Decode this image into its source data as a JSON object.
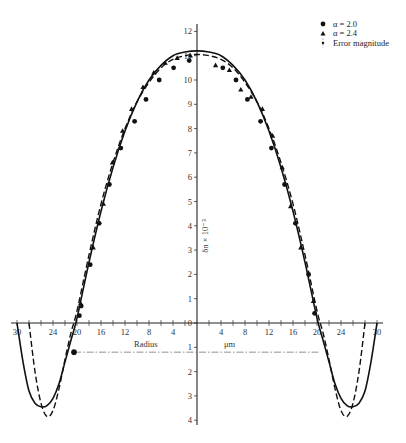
{
  "chart_data": {
    "type": "line",
    "title": "",
    "xlabel": "Radius",
    "xunit": "μm",
    "ylabel": "δn × 10⁻³",
    "xlim": [
      -31,
      31
    ],
    "ylim": [
      -4.2,
      12.3
    ],
    "x_ticks_labeled": [
      -30,
      -24,
      -20,
      -16,
      -12,
      -8,
      -4,
      4,
      8,
      12,
      16,
      20,
      24,
      30
    ],
    "x_tick_labels": [
      "30",
      "24",
      "20",
      "16",
      "12",
      "8",
      "4",
      "4",
      "8",
      "12",
      "16",
      "20",
      "24",
      "30"
    ],
    "y_ticks": [
      -4,
      -3,
      -2,
      -1,
      0,
      1,
      2,
      3,
      4,
      5,
      6,
      7,
      8,
      9,
      10,
      11,
      12
    ],
    "grid": false,
    "legend_position": "top-right",
    "legend": [
      {
        "marker": "circle",
        "label": "α = 2.0"
      },
      {
        "marker": "triangle",
        "label": "α = 2.4"
      },
      {
        "marker": "errorbar",
        "label": "Error magnitude"
      }
    ],
    "series": [
      {
        "name": "α = 2.0 (fit)",
        "style": "solid",
        "x": [
          -30,
          -29,
          -28,
          -27,
          -26,
          -25,
          -24,
          -23,
          -22,
          -21,
          -20,
          -18,
          -16,
          -14,
          -12,
          -10,
          -8,
          -6,
          -4,
          -2,
          0,
          2,
          4,
          6,
          8,
          10,
          12,
          14,
          16,
          18,
          20,
          21,
          22,
          23,
          24,
          25,
          26,
          27,
          28,
          29,
          30
        ],
        "y": [
          0.0,
          -1.6,
          -2.8,
          -3.3,
          -3.45,
          -3.4,
          -3.1,
          -2.5,
          -1.6,
          -0.7,
          0.2,
          2.5,
          4.6,
          6.4,
          7.9,
          9.1,
          10.0,
          10.6,
          11.0,
          11.15,
          11.2,
          11.15,
          11.0,
          10.6,
          10.0,
          9.1,
          7.9,
          6.4,
          4.6,
          2.5,
          0.2,
          -0.7,
          -1.6,
          -2.5,
          -3.1,
          -3.4,
          -3.45,
          -3.3,
          -2.8,
          -1.6,
          0.0
        ]
      },
      {
        "name": "α = 2.4 (fit)",
        "style": "dashed",
        "x": [
          -28,
          -27,
          -26,
          -25,
          -24,
          -23,
          -22,
          -21,
          -20,
          -18,
          -16,
          -14,
          -12,
          -10,
          -8,
          -6,
          -4,
          -2,
          0,
          2,
          4,
          6,
          8,
          10,
          12,
          14,
          16,
          18,
          20,
          21,
          22,
          23,
          24,
          25,
          26,
          27,
          28
        ],
        "y": [
          0.0,
          -2.0,
          -3.3,
          -3.85,
          -3.6,
          -2.7,
          -1.5,
          -0.4,
          0.5,
          2.8,
          4.9,
          6.6,
          8.0,
          9.1,
          9.9,
          10.5,
          10.85,
          11.0,
          11.05,
          11.0,
          10.85,
          10.5,
          9.9,
          9.1,
          8.0,
          6.6,
          4.9,
          2.8,
          0.5,
          -0.4,
          -1.5,
          -2.7,
          -3.6,
          -3.85,
          -3.3,
          -2.0,
          0.0
        ]
      },
      {
        "name": "α = 2.0 (data)",
        "style": "markers-circle",
        "x": [
          -19.6,
          -19.3,
          -17.8,
          -16.3,
          -14.6,
          -12.7,
          -10.4,
          -8.5,
          -6.3,
          -3.9,
          -1.3,
          4.3,
          6.5,
          8.4,
          10.6,
          12.4,
          14.6,
          16.4,
          18.6,
          19.6
        ],
        "y": [
          0.3,
          0.7,
          2.4,
          4.1,
          5.7,
          7.2,
          8.3,
          9.2,
          10.0,
          10.5,
          10.8,
          10.5,
          10.0,
          9.2,
          8.3,
          7.2,
          5.7,
          4.1,
          2.0,
          0.4
        ]
      },
      {
        "name": "α = 2.4 (data)",
        "style": "markers-triangle",
        "x": [
          -19.4,
          -17.3,
          -15.6,
          -14.1,
          -12.4,
          -10.9,
          -9.0,
          -7.2,
          -5.3,
          -3.3,
          -1.1,
          3.1,
          5.4,
          7.3,
          9.0,
          10.9,
          12.6,
          14.2,
          15.6,
          17.3,
          19.4
        ],
        "y": [
          0.8,
          3.1,
          4.9,
          6.6,
          7.9,
          8.8,
          9.7,
          10.3,
          10.7,
          10.9,
          11.0,
          10.6,
          10.4,
          9.6,
          9.3,
          8.8,
          7.7,
          6.4,
          4.8,
          3.1,
          0.9
        ]
      },
      {
        "name": "Error magnitude",
        "style": "dash-dot reference line",
        "x": [
          -20.5,
          20.5
        ],
        "y": [
          -1.2,
          -1.2
        ],
        "annotated_point": {
          "x": -20.5,
          "y": -1.2,
          "marker": "circle"
        }
      }
    ]
  }
}
